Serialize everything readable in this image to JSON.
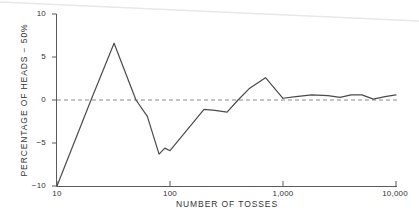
{
  "chart_data": {
    "type": "line",
    "title": "",
    "subtitle": "",
    "xlabel": "NUMBER OF TOSSES",
    "ylabel": "PERCENTAGE OF HEADS − 50%",
    "xscale": "log",
    "xlim": [
      10,
      10000
    ],
    "ylim": [
      -10,
      10
    ],
    "xticks": [
      10,
      100,
      1000,
      10000
    ],
    "xtick_labels": [
      "10",
      "100",
      "1,000",
      "10,000"
    ],
    "yticks": [
      10,
      5,
      0,
      -5,
      -10
    ],
    "ytick_labels": [
      "10",
      "5",
      "0",
      "−5",
      "−10"
    ],
    "grid": false,
    "legend": null,
    "legend_position": "none",
    "reference_line": {
      "y": 0,
      "style": "dashed",
      "color": "#8a8a8a"
    },
    "series": [
      {
        "name": "percentage of heads minus 50%",
        "color": "#4a4a4a",
        "x": [
          10,
          20,
          32,
          50,
          63,
          80,
          90,
          100,
          200,
          250,
          320,
          400,
          500,
          700,
          1000,
          1300,
          1800,
          2500,
          3200,
          4000,
          5000,
          6300,
          8000,
          10000
        ],
        "y": [
          -10.0,
          0.0,
          6.6,
          0.0,
          -1.9,
          -6.3,
          -5.6,
          -5.9,
          -1.1,
          -1.2,
          -1.4,
          0.0,
          1.3,
          2.6,
          0.2,
          0.4,
          0.6,
          0.5,
          0.3,
          0.6,
          0.6,
          0.1,
          0.4,
          0.6
        ]
      }
    ],
    "axis_color": "#555555",
    "background": "#ffffff"
  },
  "artifact": {
    "name": "scan-edge-line",
    "color": "#e8e8e8"
  }
}
